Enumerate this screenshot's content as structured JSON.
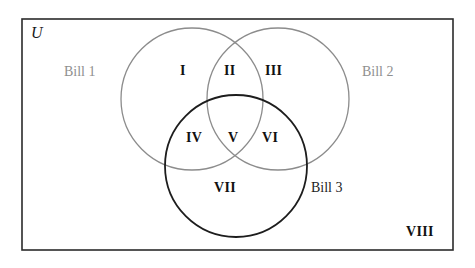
{
  "diagram": {
    "type": "venn-3-set",
    "universe": {
      "label": "U",
      "rect": {
        "x": 22,
        "y": 19,
        "width": 431,
        "height": 231
      },
      "border_color": "#2b2b2b"
    },
    "sets": [
      {
        "id": "bill1",
        "label": "Bill 1",
        "cx": 192,
        "cy": 99,
        "r": 71,
        "stroke": "#8c8c8c",
        "stroke_width": 1.3
      },
      {
        "id": "bill2",
        "label": "Bill 2",
        "cx": 278,
        "cy": 99,
        "r": 71,
        "stroke": "#8c8c8c",
        "stroke_width": 1.3
      },
      {
        "id": "bill3",
        "label": "Bill 3",
        "cx": 236,
        "cy": 166,
        "r": 71,
        "stroke": "#1d1d1d",
        "stroke_width": 1.8
      }
    ],
    "regions": [
      {
        "id": "I",
        "label": "I",
        "meaning": "Bill 1 only"
      },
      {
        "id": "II",
        "label": "II",
        "meaning": "Bill 1 and Bill 2 only"
      },
      {
        "id": "III",
        "label": "III",
        "meaning": "Bill 2 only"
      },
      {
        "id": "IV",
        "label": "IV",
        "meaning": "Bill 1 and Bill 3 only"
      },
      {
        "id": "V",
        "label": "V",
        "meaning": "Bill 1 and Bill 2 and Bill 3"
      },
      {
        "id": "VI",
        "label": "VI",
        "meaning": "Bill 2 and Bill 3 only"
      },
      {
        "id": "VII",
        "label": "VII",
        "meaning": "Bill 3 only"
      },
      {
        "id": "VIII",
        "label": "VIII",
        "meaning": "Outside all sets"
      }
    ]
  },
  "chart_data": {
    "type": "diagram",
    "title": "",
    "categories": [
      "I",
      "II",
      "III",
      "IV",
      "V",
      "VI",
      "VII",
      "VIII"
    ],
    "legend": [
      "Bill 1",
      "Bill 2",
      "Bill 3"
    ],
    "annotations": [
      "U"
    ]
  }
}
